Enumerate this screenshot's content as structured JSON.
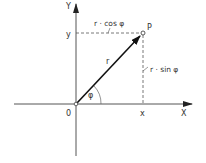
{
  "diagram": {
    "axes": {
      "x_axis_label": "X",
      "y_axis_label": "Y",
      "origin_label": "0"
    },
    "point": {
      "label": "P",
      "x_label": "x",
      "y_label": "y"
    },
    "vector": {
      "label": "r"
    },
    "angle": {
      "label": "φ"
    },
    "projections": {
      "horizontal_label": "r · cos φ",
      "vertical_label": "r · sin φ"
    },
    "colors": {
      "line": "#333333",
      "axis": "#555555",
      "background": "#ffffff"
    }
  }
}
